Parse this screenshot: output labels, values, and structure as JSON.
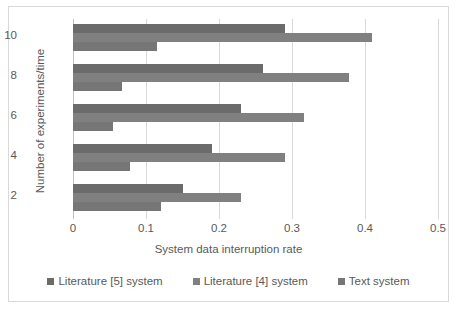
{
  "chart_data": {
    "type": "bar",
    "orientation": "horizontal",
    "title": "",
    "xlabel": "System data interruption rate",
    "ylabel": "Number of experiments/time",
    "categories": [
      "2",
      "4",
      "6",
      "8",
      "10"
    ],
    "xlim": [
      0,
      0.5
    ],
    "xticks": [
      "0",
      "0.1",
      "0.2",
      "0.3",
      "0.4",
      "0.5"
    ],
    "xtick_values": [
      0,
      0.1,
      0.2,
      0.3,
      0.4,
      0.5
    ],
    "yticks": [
      "2",
      "4",
      "6",
      "8",
      "10"
    ],
    "grid": "vertical",
    "legend_position": "bottom",
    "series": [
      {
        "name": "Literature [5] system",
        "color": "#6b6b6b",
        "values": [
          0.15,
          0.19,
          0.23,
          0.26,
          0.29
        ]
      },
      {
        "name": "Literature [4] system",
        "color": "#808080",
        "values": [
          0.23,
          0.29,
          0.317,
          0.378,
          0.41
        ]
      },
      {
        "name": "Text system",
        "color": "#767676",
        "values": [
          0.12,
          0.078,
          0.055,
          0.067,
          0.115
        ]
      }
    ]
  },
  "style": {
    "frame_border": "#d9d9d9",
    "gridline": "#d9d9d9",
    "axis_line": "#bfbfbf",
    "text": "#595959",
    "background": "#ffffff"
  }
}
